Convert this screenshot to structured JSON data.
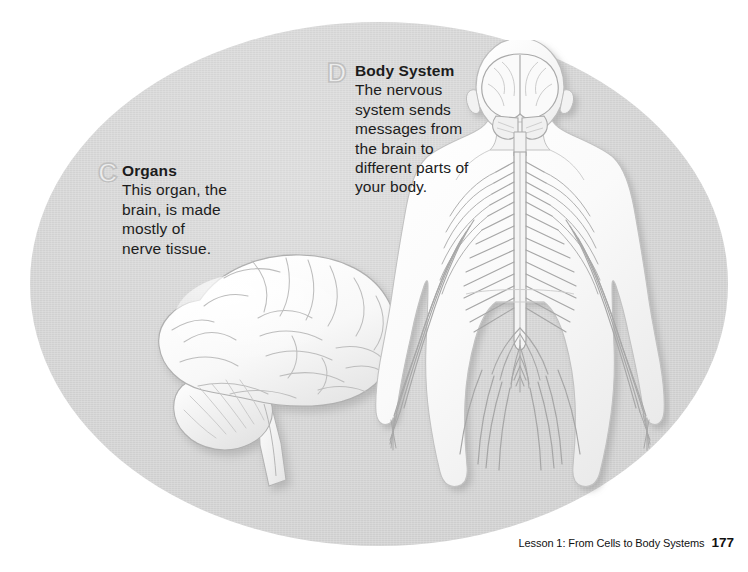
{
  "page": {
    "background_color": "#ffffff",
    "oval_color": "#d4d4d4"
  },
  "callouts": [
    {
      "marker": "C",
      "heading": "Organs",
      "body": "This organ, the\nbrain, is made\nmostly of\nnerve tissue."
    },
    {
      "marker": "D",
      "heading": "Body System",
      "body": "The nervous\nsystem sends\nmessages from\nthe brain to\ndifferent parts of\nyour body."
    }
  ],
  "illustrations": [
    {
      "name": "brain",
      "description": "Lateral view illustration of a human brain, white with gray gyri outlines, cerebellum and brain stem"
    },
    {
      "name": "nervous-system",
      "description": "Posterior view of a human figure showing the brain, spinal cord and branching peripheral nerves"
    }
  ],
  "footer": {
    "text": "Lesson 1: From Cells to Body Systems",
    "page_number": "177"
  }
}
